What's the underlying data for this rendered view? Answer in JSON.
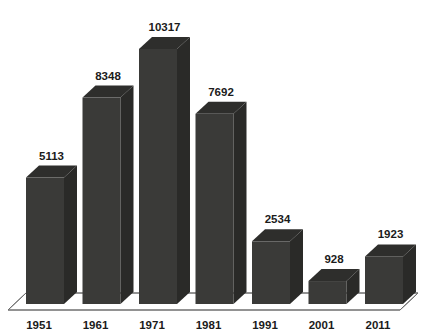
{
  "chart_data": {
    "type": "bar",
    "title": "",
    "subtitle": "",
    "xlabel": "",
    "ylabel": "",
    "categories": [
      "1951",
      "1961",
      "1971",
      "1981",
      "1991",
      "2001",
      "2011"
    ],
    "values": [
      5113,
      8348,
      10317,
      7692,
      2534,
      928,
      1923
    ],
    "data_labels": [
      "5113",
      "8348",
      "10317",
      "7692",
      "2534",
      "928",
      "1923"
    ],
    "ylim": [
      0,
      11000
    ],
    "grid": false,
    "legend": false,
    "legend_position": "none",
    "style": "3d-column",
    "series": [
      {
        "name": "",
        "values": [
          5113,
          8348,
          10317,
          7692,
          2534,
          928,
          1923
        ]
      }
    ],
    "colors": {
      "bar_front": "#3a3a38",
      "bar_top": "#2e2e2c",
      "bar_side": "#2a2a28",
      "background": "#ffffff",
      "axis_line": "#6e6e6e",
      "label_text": "#1b1b1b"
    }
  }
}
